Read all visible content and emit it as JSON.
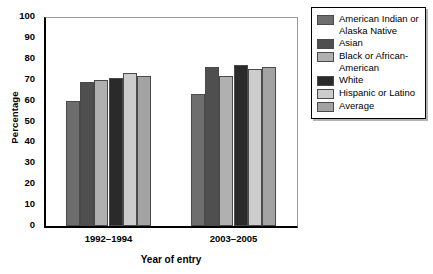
{
  "chart_data": {
    "type": "bar",
    "title": "",
    "xlabel": "Year of entry",
    "ylabel": "Percentage",
    "categories": [
      "1992–1994",
      "2003–2005"
    ],
    "ylim": [
      0,
      100
    ],
    "ytick_step": 10,
    "yticks": [
      0,
      10,
      20,
      30,
      40,
      50,
      60,
      70,
      80,
      90,
      100
    ],
    "grid": false,
    "legend_position": "right",
    "series": [
      {
        "name": "American Indian or Alaska Native",
        "values": [
          60,
          63
        ],
        "color": "#6e6e6e"
      },
      {
        "name": "Asian",
        "values": [
          69,
          76
        ],
        "color": "#4f4f4f"
      },
      {
        "name": "Black or African-American",
        "values": [
          70,
          72
        ],
        "color": "#b0b0b0"
      },
      {
        "name": "White",
        "values": [
          71,
          77
        ],
        "color": "#2a2a2a"
      },
      {
        "name": "Hispanic or Latino",
        "values": [
          73,
          75
        ],
        "color": "#cccccc"
      },
      {
        "name": "Average",
        "values": [
          72,
          76
        ],
        "color": "#a3a3a3"
      }
    ]
  },
  "legend": {
    "items": [
      {
        "label": "American Indian or Alaska Native"
      },
      {
        "label": "Asian"
      },
      {
        "label": "Black or African-American"
      },
      {
        "label": "White"
      },
      {
        "label": "Hispanic or Latino"
      },
      {
        "label": "Average"
      }
    ]
  }
}
